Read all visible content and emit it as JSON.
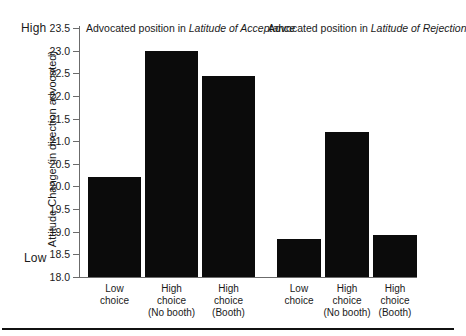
{
  "axis": {
    "high_label": "High",
    "low_label": "Low",
    "y_title": "Attitude Change (in direction advocated)",
    "ticks": [
      "23.5",
      "23.0",
      "22.5",
      "22.0",
      "21.5",
      "21.0",
      "20.5",
      "20.0",
      "19.5",
      "19.0",
      "18.5",
      "18.0"
    ]
  },
  "groups": [
    {
      "title_prefix": "Advocated position in ",
      "title_italic": "Latitude of Acceptance"
    },
    {
      "title_prefix": "Advocated position in ",
      "title_italic": "Latitude of Rejection"
    }
  ],
  "categories": [
    {
      "line1": "Low",
      "line2": "choice",
      "line3": ""
    },
    {
      "line1": "High",
      "line2": "choice",
      "line3": "(No booth)"
    },
    {
      "line1": "High",
      "line2": "choice",
      "line3": "(Booth)"
    },
    {
      "line1": "Low",
      "line2": "choice",
      "line3": ""
    },
    {
      "line1": "High",
      "line2": "choice",
      "line3": "(No booth)"
    },
    {
      "line1": "High",
      "line2": "choice",
      "line3": "(Booth)"
    }
  ],
  "colors": {
    "bar": "#0b0b0b",
    "axis": "#6b6b6b",
    "text": "#1a1a1a"
  },
  "chart_data": {
    "type": "bar",
    "title": "",
    "xlabel": "",
    "ylabel": "Attitude Change (in direction advocated)",
    "ylim": [
      18.0,
      23.5
    ],
    "grid": false,
    "legend": "none",
    "yticks": [
      18.0,
      18.5,
      19.0,
      19.5,
      20.0,
      20.5,
      21.0,
      21.5,
      22.0,
      22.5,
      23.0,
      23.5
    ],
    "ytick_endpoint_labels": {
      "top": "High",
      "bottom": "Low"
    },
    "groups": [
      {
        "name": "Advocated position in Latitude of Acceptance",
        "categories": [
          "Low choice",
          "High choice (No booth)",
          "High choice (Booth)"
        ],
        "values": [
          20.2,
          23.0,
          22.45
        ]
      },
      {
        "name": "Advocated position in Latitude of Rejection",
        "categories": [
          "Low choice",
          "High choice (No booth)",
          "High choice (Booth)"
        ],
        "values": [
          18.85,
          21.2,
          18.93
        ]
      }
    ],
    "categories": [
      "Low choice",
      "High choice (No booth)",
      "High choice (Booth)",
      "Low choice",
      "High choice (No booth)",
      "High choice (Booth)"
    ],
    "values": [
      20.2,
      23.0,
      22.45,
      18.85,
      21.2,
      18.93
    ]
  }
}
